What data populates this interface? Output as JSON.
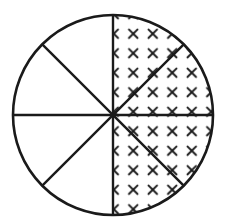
{
  "diagram": {
    "type": "fraction-circle",
    "total_sectors": 8,
    "shaded_sectors": 4,
    "shaded_side": "right half",
    "shading_pattern": "x-marks",
    "colors": {
      "stroke": "#1a1a1a",
      "background": "#ffffff",
      "pattern": "#1a1a1a"
    },
    "circle": {
      "cx": 113,
      "cy": 115,
      "r": 100
    }
  }
}
